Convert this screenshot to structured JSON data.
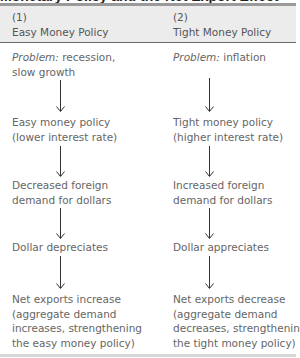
{
  "title": "Monetary Policy and the Net Export Effect",
  "columns": [
    {
      "number": "(1)",
      "heading": "Easy Money Policy",
      "problem_label": "Problem:",
      "problem_text_line1": " recession,",
      "problem_text_line2": "slow growth",
      "steps": [
        {
          "line1": "Easy money policy",
          "line2": "(lower interest rate)"
        },
        {
          "line1": "Decreased foreign",
          "line2": "demand for dollars"
        },
        {
          "line1": "Dollar depreciates"
        },
        {
          "line1": "Net exports increase",
          "line2": "(aggregate demand",
          "line3": "increases, strengthening",
          "line4": "the easy money policy)"
        }
      ]
    },
    {
      "number": "(2)",
      "heading": "Tight Money Policy",
      "problem_label": "Problem:",
      "problem_text_line1": " inflation",
      "steps": [
        {
          "line1": "Tight money policy",
          "line2": "(higher interest rate)"
        },
        {
          "line1": "Increased foreign",
          "line2": "demand for dollars"
        },
        {
          "line1": "Dollar appreciates"
        },
        {
          "line1": "Net exports decrease",
          "line2": "(aggregate demand",
          "line3": "decreases, strengthening",
          "line4": "the tight money policy)"
        }
      ]
    }
  ],
  "colors": {
    "header_band": "#ececec",
    "top_rule": "#9a9a9a",
    "header_rule": "#6a6a6a",
    "text": "#666666",
    "arrow": "#333333"
  }
}
